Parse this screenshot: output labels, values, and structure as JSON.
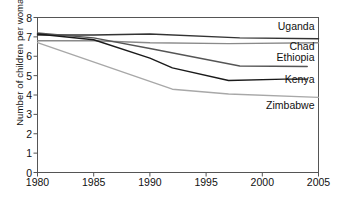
{
  "chart_data": {
    "type": "line",
    "title": "",
    "subtitle": "",
    "xlabel": "",
    "ylabel": "Number of children per woman",
    "xlim": [
      1980,
      2005
    ],
    "ylim": [
      0,
      8
    ],
    "xticks": [
      1980,
      1985,
      1990,
      1995,
      2000,
      2005
    ],
    "yticks": [
      0,
      1,
      2,
      3,
      4,
      5,
      6,
      7,
      8
    ],
    "grid": false,
    "legend": "inline-right-labels",
    "series": [
      {
        "name": "Uganda",
        "color": "#333333",
        "x": [
          1980,
          1985,
          1990,
          1998,
          2005
        ],
        "values": [
          7.1,
          7.1,
          7.15,
          6.95,
          6.9
        ]
      },
      {
        "name": "Chad",
        "color": "#8a8a8a",
        "x": [
          1980,
          1985,
          1990,
          1997,
          2005
        ],
        "values": [
          6.8,
          6.8,
          6.7,
          6.65,
          6.7
        ]
      },
      {
        "name": "Ethiopia",
        "color": "#555555",
        "x": [
          1980,
          1985,
          1990,
          1998,
          2004
        ],
        "values": [
          7.2,
          6.95,
          6.4,
          5.5,
          5.47
        ]
      },
      {
        "name": "Kenya",
        "color": "#1a1a1a",
        "x": [
          1980,
          1985,
          1990,
          1992,
          1997,
          2002,
          2004
        ],
        "values": [
          7.15,
          6.85,
          5.9,
          5.4,
          4.75,
          4.82,
          4.82
        ]
      },
      {
        "name": "Zimbabwe",
        "color": "#a8a8a8",
        "x": [
          1980,
          1992,
          1997,
          2005
        ],
        "values": [
          6.7,
          4.3,
          4.05,
          3.88
        ]
      }
    ]
  },
  "axis": {
    "y_title": "Number of children per woman",
    "y_tick_labels": [
      "8",
      "7",
      "6",
      "5",
      "4",
      "3",
      "2",
      "1",
      "0"
    ],
    "x_tick_labels": [
      "1980",
      "1985",
      "1990",
      "1995",
      "2000",
      "2005"
    ]
  },
  "series_labels": [
    {
      "text": "Uganda",
      "value": 7.55
    },
    {
      "text": "Chad",
      "value": 6.55
    },
    {
      "text": "Ethiopia",
      "value": 5.95
    },
    {
      "text": "Kenya",
      "value": 4.85
    },
    {
      "text": "Zimbabwe",
      "value": 3.5
    }
  ],
  "style": {
    "plot_border": "#555555",
    "background": "#ffffff",
    "text": "#111111"
  }
}
